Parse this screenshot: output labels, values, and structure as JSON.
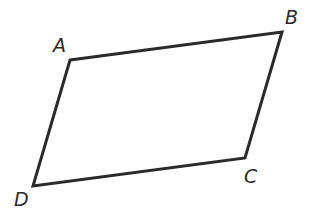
{
  "diagram": {
    "shape": "parallelogram",
    "stroke_color": "#2a2a2a",
    "background": "#ffffff",
    "vertices": [
      {
        "name": "A",
        "x": 70,
        "y": 60,
        "label_x": 53,
        "label_y": 52
      },
      {
        "name": "B",
        "x": 282,
        "y": 32,
        "label_x": 285,
        "label_y": 24
      },
      {
        "name": "C",
        "x": 245,
        "y": 158,
        "label_x": 244,
        "label_y": 183
      },
      {
        "name": "D",
        "x": 33,
        "y": 186,
        "label_x": 14,
        "label_y": 206
      }
    ]
  }
}
